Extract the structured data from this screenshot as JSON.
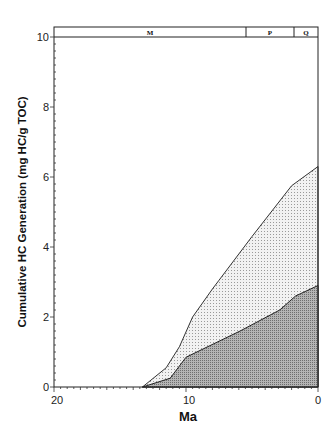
{
  "chart_data": {
    "type": "area",
    "title": "",
    "xlabel": "Ma",
    "ylabel": "Cumulative HC Generation (mg HC/g TOC)",
    "xlim": [
      20,
      0
    ],
    "ylim": [
      0,
      10
    ],
    "x_ticks": [
      "20",
      "10",
      "0"
    ],
    "y_ticks": [
      "0",
      "2",
      "4",
      "6",
      "8",
      "10"
    ],
    "grid": false,
    "legend": null,
    "epoch_bands": [
      {
        "label": "M",
        "from": 20,
        "to": 5.3
      },
      {
        "label": "P",
        "from": 5.3,
        "to": 1.8
      },
      {
        "label": "Q",
        "from": 1.8,
        "to": 0
      }
    ],
    "series": [
      {
        "name": "upper (total) cumulative generation",
        "fill": "light stipple",
        "x": [
          13.3,
          11.5,
          10.5,
          9.5,
          8.0,
          7.5,
          5.0,
          2.0,
          0
        ],
        "y": [
          0,
          0.55,
          1.15,
          2.0,
          2.8,
          3.05,
          4.3,
          5.75,
          6.3
        ]
      },
      {
        "name": "lower cumulative generation",
        "fill": "dark stipple",
        "x": [
          13.3,
          11.2,
          10.0,
          5.9,
          2.9,
          1.7,
          0
        ],
        "y": [
          0,
          0.25,
          0.85,
          1.6,
          2.2,
          2.6,
          2.9
        ]
      }
    ]
  },
  "labels": {
    "y_axis_title": "Cumulative HC Generation (mg HC/g TOC)",
    "x_axis_title": "Ma",
    "band_m": "M",
    "band_p": "P",
    "band_q": "Q",
    "x_tick_20": "20",
    "x_tick_10": "10",
    "x_tick_0": "0",
    "y_tick_0": "0",
    "y_tick_2": "2",
    "y_tick_4": "4",
    "y_tick_6": "6",
    "y_tick_8": "8",
    "y_tick_10": "10"
  }
}
